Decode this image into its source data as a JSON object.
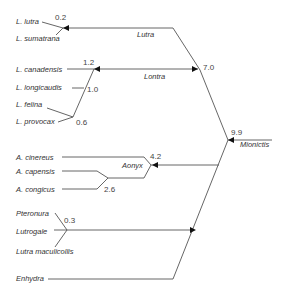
{
  "diagram": {
    "type": "phylogenetic-tree",
    "colors": {
      "line": "#555555",
      "text": "#333333",
      "arrow": "#111111"
    },
    "taxa": [
      {
        "label": "L. lutra"
      },
      {
        "label": "L. sumatrana"
      },
      {
        "label": "L. canadensis"
      },
      {
        "label": "L. longicaudis"
      },
      {
        "label": "L. felina"
      },
      {
        "label": "L. provocax"
      },
      {
        "label": "A. cinereus"
      },
      {
        "label": "A. capensis"
      },
      {
        "label": "A. congicus"
      },
      {
        "label": "Pteronura"
      },
      {
        "label": "Lutrogale"
      },
      {
        "label": "Lutra maculicollis"
      },
      {
        "label": "Enhydra"
      }
    ],
    "clades": [
      {
        "label": "Lutra"
      },
      {
        "label": "Lontra"
      },
      {
        "label": "Aonyx"
      },
      {
        "label": "Mionictis"
      }
    ],
    "node_values": [
      {
        "label": "0.2"
      },
      {
        "label": "1.2"
      },
      {
        "label": "1.0"
      },
      {
        "label": "0.6"
      },
      {
        "label": "7.0"
      },
      {
        "label": "9.9"
      },
      {
        "label": "4.2"
      },
      {
        "label": "2.6"
      },
      {
        "label": "0.3"
      }
    ]
  }
}
